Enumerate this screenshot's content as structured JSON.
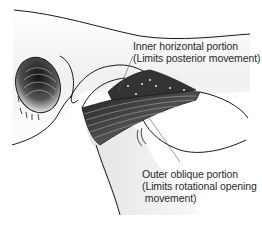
{
  "diagram": {
    "labels": {
      "inner": {
        "line1": "Inner horizontal portion",
        "line2": "(Limits posterior movement)"
      },
      "outer": {
        "line1": "Outer oblique portion",
        "line2": "(Limits rotational opening",
        "line3": " movement)"
      }
    },
    "parts": [
      "external-auditory-meatus",
      "zygomatic-arch",
      "condylar-neck",
      "ligament-fibers",
      "coronoid-notch"
    ],
    "colors": {
      "ink": "#1a1a1a",
      "shade": "#9a9a9a",
      "background": "#ffffff"
    }
  }
}
